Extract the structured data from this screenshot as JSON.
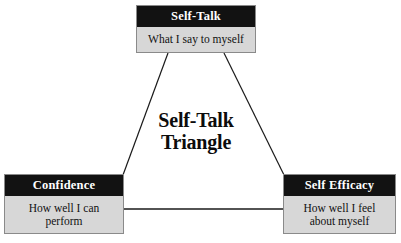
{
  "diagram": {
    "title": "Self-Talk\nTriangle",
    "background_color": "#ffffff",
    "header_color": "#121212",
    "body_color": "#d7d7d7",
    "border_color": "#8a8a8a",
    "line_color": "#1a1a1a",
    "nodes": [
      {
        "id": "self-talk",
        "header": "Self-Talk",
        "body": "What I say to myself",
        "position": "top"
      },
      {
        "id": "confidence",
        "header": "Confidence",
        "body": "How well I can\nperform",
        "position": "bottom-left"
      },
      {
        "id": "self-efficacy",
        "header": "Self Efficacy",
        "body": "How well I feel\nabout myself",
        "position": "bottom-right"
      }
    ],
    "connections": [
      {
        "from": "self-talk",
        "to": "confidence"
      },
      {
        "from": "self-talk",
        "to": "self-efficacy"
      },
      {
        "from": "confidence",
        "to": "self-efficacy"
      }
    ]
  }
}
